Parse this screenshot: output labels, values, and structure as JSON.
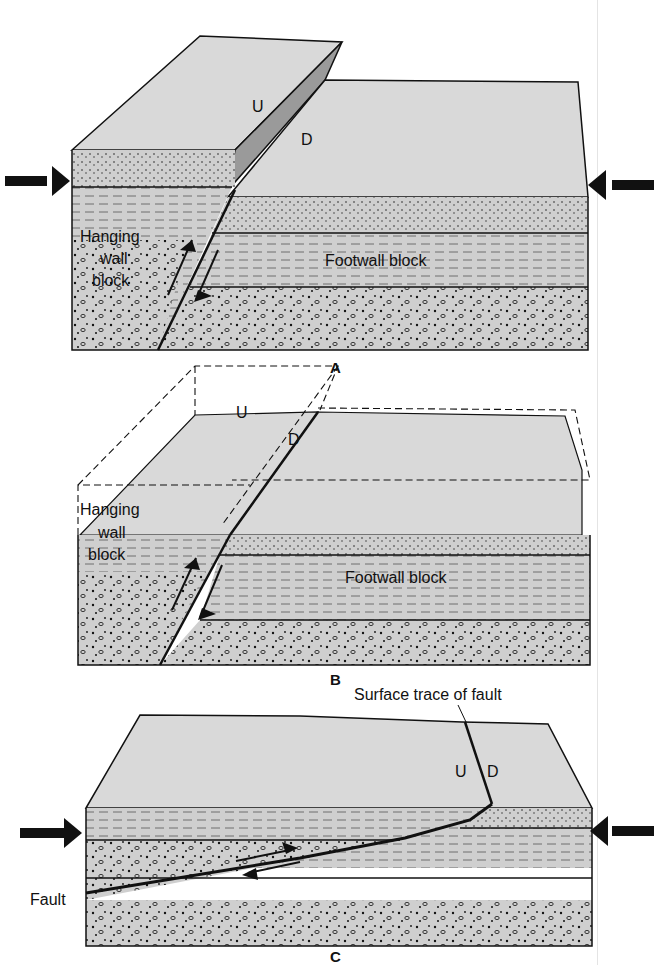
{
  "colors": {
    "surface": "#d9d9d9",
    "rock": "#cfcfcf",
    "line": "#111111",
    "faultplane": "#9a9a9a"
  },
  "panels": [
    {
      "caption": "A",
      "labels": {
        "up": "U",
        "down": "D",
        "hanging_wall": [
          "Hanging",
          "wall",
          "block"
        ],
        "footwall": "Footwall block"
      }
    },
    {
      "caption": "B",
      "labels": {
        "up": "U",
        "down": "D",
        "hanging_wall": [
          "Hanging",
          "wall",
          "block"
        ],
        "footwall": "Footwall block"
      }
    },
    {
      "caption": "C",
      "labels": {
        "up": "U",
        "down": "D",
        "surface_trace": "Surface trace of fault",
        "fault": "Fault"
      }
    }
  ]
}
